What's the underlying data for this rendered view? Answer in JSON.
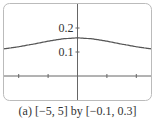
{
  "chart_data": {
    "type": "line",
    "title": "",
    "caption": "(a) [−5, 5] by [−0.1, 0.3]",
    "xlabel": "",
    "ylabel": "",
    "xlim": [
      -5,
      5
    ],
    "ylim": [
      -0.1,
      0.3
    ],
    "x_ticks": [
      -4,
      -2,
      2,
      4
    ],
    "y_ticks": [
      0.1,
      0.2
    ],
    "y_tick_labels": [
      "0.1",
      "0.2"
    ],
    "grid": false,
    "legend": null,
    "series": [
      {
        "name": "f(x)",
        "x": [
          -5,
          -4,
          -3,
          -2,
          -1,
          0,
          1,
          2,
          3,
          4,
          5
        ],
        "y": [
          0.113,
          0.122,
          0.133,
          0.145,
          0.155,
          0.159,
          0.155,
          0.145,
          0.133,
          0.122,
          0.113
        ]
      }
    ],
    "colors": {
      "curve": "#555555",
      "axes": "#666666",
      "frame": "#bbbbbb"
    }
  }
}
